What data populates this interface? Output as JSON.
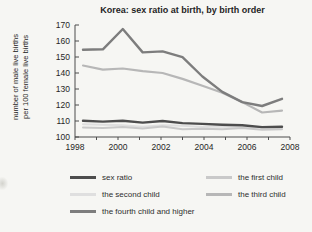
{
  "title": "Korea: sex ratio at birth, by birth order",
  "y_axis_label_line1": "number of male live births",
  "y_axis_label_line2": "per 100 female live births",
  "chart_data": {
    "type": "line",
    "title": "Korea: sex ratio at birth, by birth order",
    "ylabel": "number of male live births per 100 female live births",
    "xlabel": "",
    "grid": false,
    "legend_position": "bottom",
    "ylim": [
      100,
      170
    ],
    "yticks": [
      100,
      110,
      120,
      130,
      140,
      150,
      160,
      170
    ],
    "xticks_labeled": [
      1998,
      2000,
      2002,
      2004,
      2006,
      2008
    ],
    "x": [
      1998,
      1999,
      2000,
      2001,
      2002,
      2003,
      2004,
      2005,
      2006,
      2007,
      2008
    ],
    "series": [
      {
        "name": "sex ratio",
        "color": "#4d4d4d",
        "width": 2.4,
        "values": [
          110.1,
          109.6,
          110.2,
          109.0,
          110.0,
          108.7,
          108.2,
          107.7,
          107.4,
          106.2,
          106.4
        ]
      },
      {
        "name": "the first child",
        "color": "#c9c9c9",
        "width": 2,
        "values": [
          105.9,
          105.6,
          106.2,
          105.4,
          106.5,
          104.9,
          105.2,
          104.8,
          105.6,
          104.5,
          104.9
        ]
      },
      {
        "name": "the second child",
        "color": "#dfdfdf",
        "width": 2,
        "values": [
          108.0,
          107.6,
          107.4,
          106.4,
          107.3,
          107.0,
          106.2,
          106.5,
          106.0,
          106.0,
          105.6
        ]
      },
      {
        "name": "the third child",
        "color": "#b7b7b7",
        "width": 2.2,
        "values": [
          144.7,
          142.1,
          142.8,
          141.1,
          140.0,
          136.3,
          132.0,
          127.7,
          121.8,
          115.3,
          116.5
        ]
      },
      {
        "name": "the fourth child and higher",
        "color": "#7d7d7d",
        "width": 2.4,
        "values": [
          154.5,
          154.8,
          167.5,
          152.9,
          153.5,
          149.9,
          137.8,
          128.2,
          121.8,
          119.4,
          123.9
        ]
      }
    ],
    "draw_order": [
      2,
      1,
      3,
      4,
      0
    ],
    "legend_order": [
      0,
      1,
      2,
      3,
      4
    ]
  }
}
